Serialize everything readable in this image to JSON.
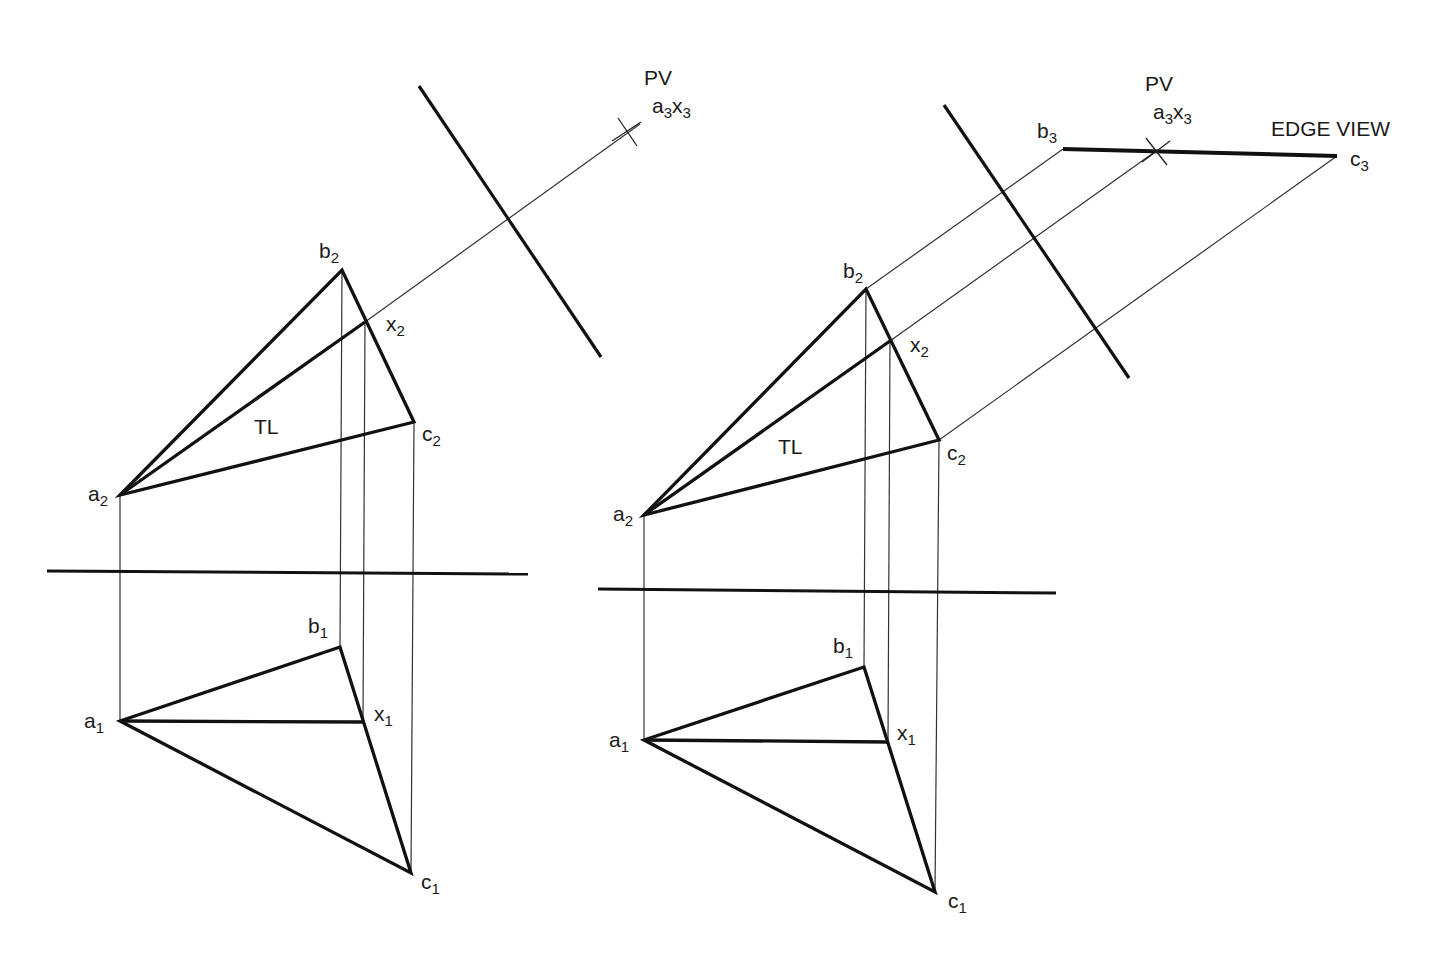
{
  "left_figure": {
    "labels": {
      "pv": "PV",
      "a3": "a",
      "a3_sub": "3",
      "x3": "x",
      "x3_sub": "3",
      "b2": "b",
      "b2_sub": "2",
      "x2": "x",
      "x2_sub": "2",
      "c2": "c",
      "c2_sub": "2",
      "a2": "a",
      "a2_sub": "2",
      "tl": "TL",
      "b1": "b",
      "b1_sub": "1",
      "x1": "x",
      "x1_sub": "1",
      "a1": "a",
      "a1_sub": "1",
      "c1": "c",
      "c1_sub": "1"
    }
  },
  "right_figure": {
    "labels": {
      "pv": "PV",
      "a3": "a",
      "a3_sub": "3",
      "x3": "x",
      "x3_sub": "3",
      "b3": "b",
      "b3_sub": "3",
      "c3": "c",
      "c3_sub": "3",
      "edge_view": "EDGE VIEW",
      "b2": "b",
      "b2_sub": "2",
      "x2": "x",
      "x2_sub": "2",
      "c2": "c",
      "c2_sub": "2",
      "a2": "a",
      "a2_sub": "2",
      "tl": "TL",
      "b1": "b",
      "b1_sub": "1",
      "x1": "x",
      "x1_sub": "1",
      "a1": "a",
      "a1_sub": "1",
      "c1": "c",
      "c1_sub": "1"
    }
  },
  "colors": {
    "line": "#111111",
    "thin": "#333333",
    "background": "#ffffff"
  }
}
